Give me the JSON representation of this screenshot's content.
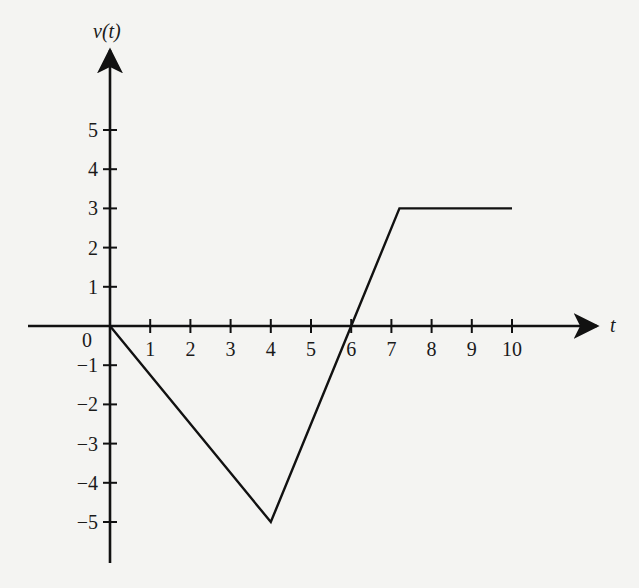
{
  "chart_data": {
    "type": "line",
    "title": "",
    "xlabel": "t",
    "ylabel": "v(t)",
    "x_ticks": [
      1,
      2,
      3,
      4,
      5,
      6,
      7,
      8,
      9,
      10
    ],
    "y_ticks": [
      -5,
      -4,
      -3,
      -2,
      -1,
      1,
      2,
      3,
      4,
      5
    ],
    "origin_label": "0",
    "xlim": [
      -2,
      12.2
    ],
    "ylim": [
      -6,
      6.5
    ],
    "grid": false,
    "legend": null,
    "series": [
      {
        "name": "v(t)",
        "x": [
          0,
          4,
          6,
          7.2,
          10
        ],
        "y": [
          0,
          -5,
          0,
          3,
          3
        ]
      }
    ],
    "colors": {
      "line": "#111111",
      "axis": "#111111",
      "background": "#f4f4f2"
    }
  },
  "labels": {
    "y_axis": "v(t)",
    "x_axis": "t",
    "origin": "0"
  }
}
